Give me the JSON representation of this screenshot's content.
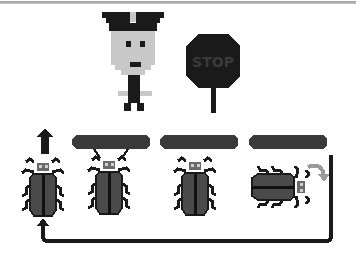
{
  "scene": {
    "description": "Pixel-art illustration: a traffic officer and a stop sign above a row of beetles queued under bars, with a return loop arrow",
    "officer": {
      "label": "traffic-officer"
    },
    "stop_sign": {
      "text": "STOP",
      "color": "#1a1a1a"
    },
    "bars": [
      {
        "id": "bar-1"
      },
      {
        "id": "bar-2"
      },
      {
        "id": "bar-3"
      }
    ],
    "beetles": [
      {
        "id": "beetle-1",
        "orientation": "up",
        "note": "leaving upward"
      },
      {
        "id": "beetle-2",
        "orientation": "up"
      },
      {
        "id": "beetle-3",
        "orientation": "up"
      },
      {
        "id": "beetle-4",
        "orientation": "left",
        "note": "rotating"
      }
    ],
    "arrows": {
      "up_arrow": {
        "direction": "up"
      },
      "rotate_arrow": {
        "direction": "clockwise",
        "color": "#9a9a9a"
      },
      "loop_arrow": {
        "direction": "back-to-start"
      }
    }
  },
  "colors": {
    "dark": "#1a1a1a",
    "beetle_body": "#4a4a4a",
    "beetle_head": "#6a6a6a",
    "bar": "#3a3a3a",
    "face": "#c8c8c8",
    "rotate_arrow": "#9a9a9a"
  }
}
